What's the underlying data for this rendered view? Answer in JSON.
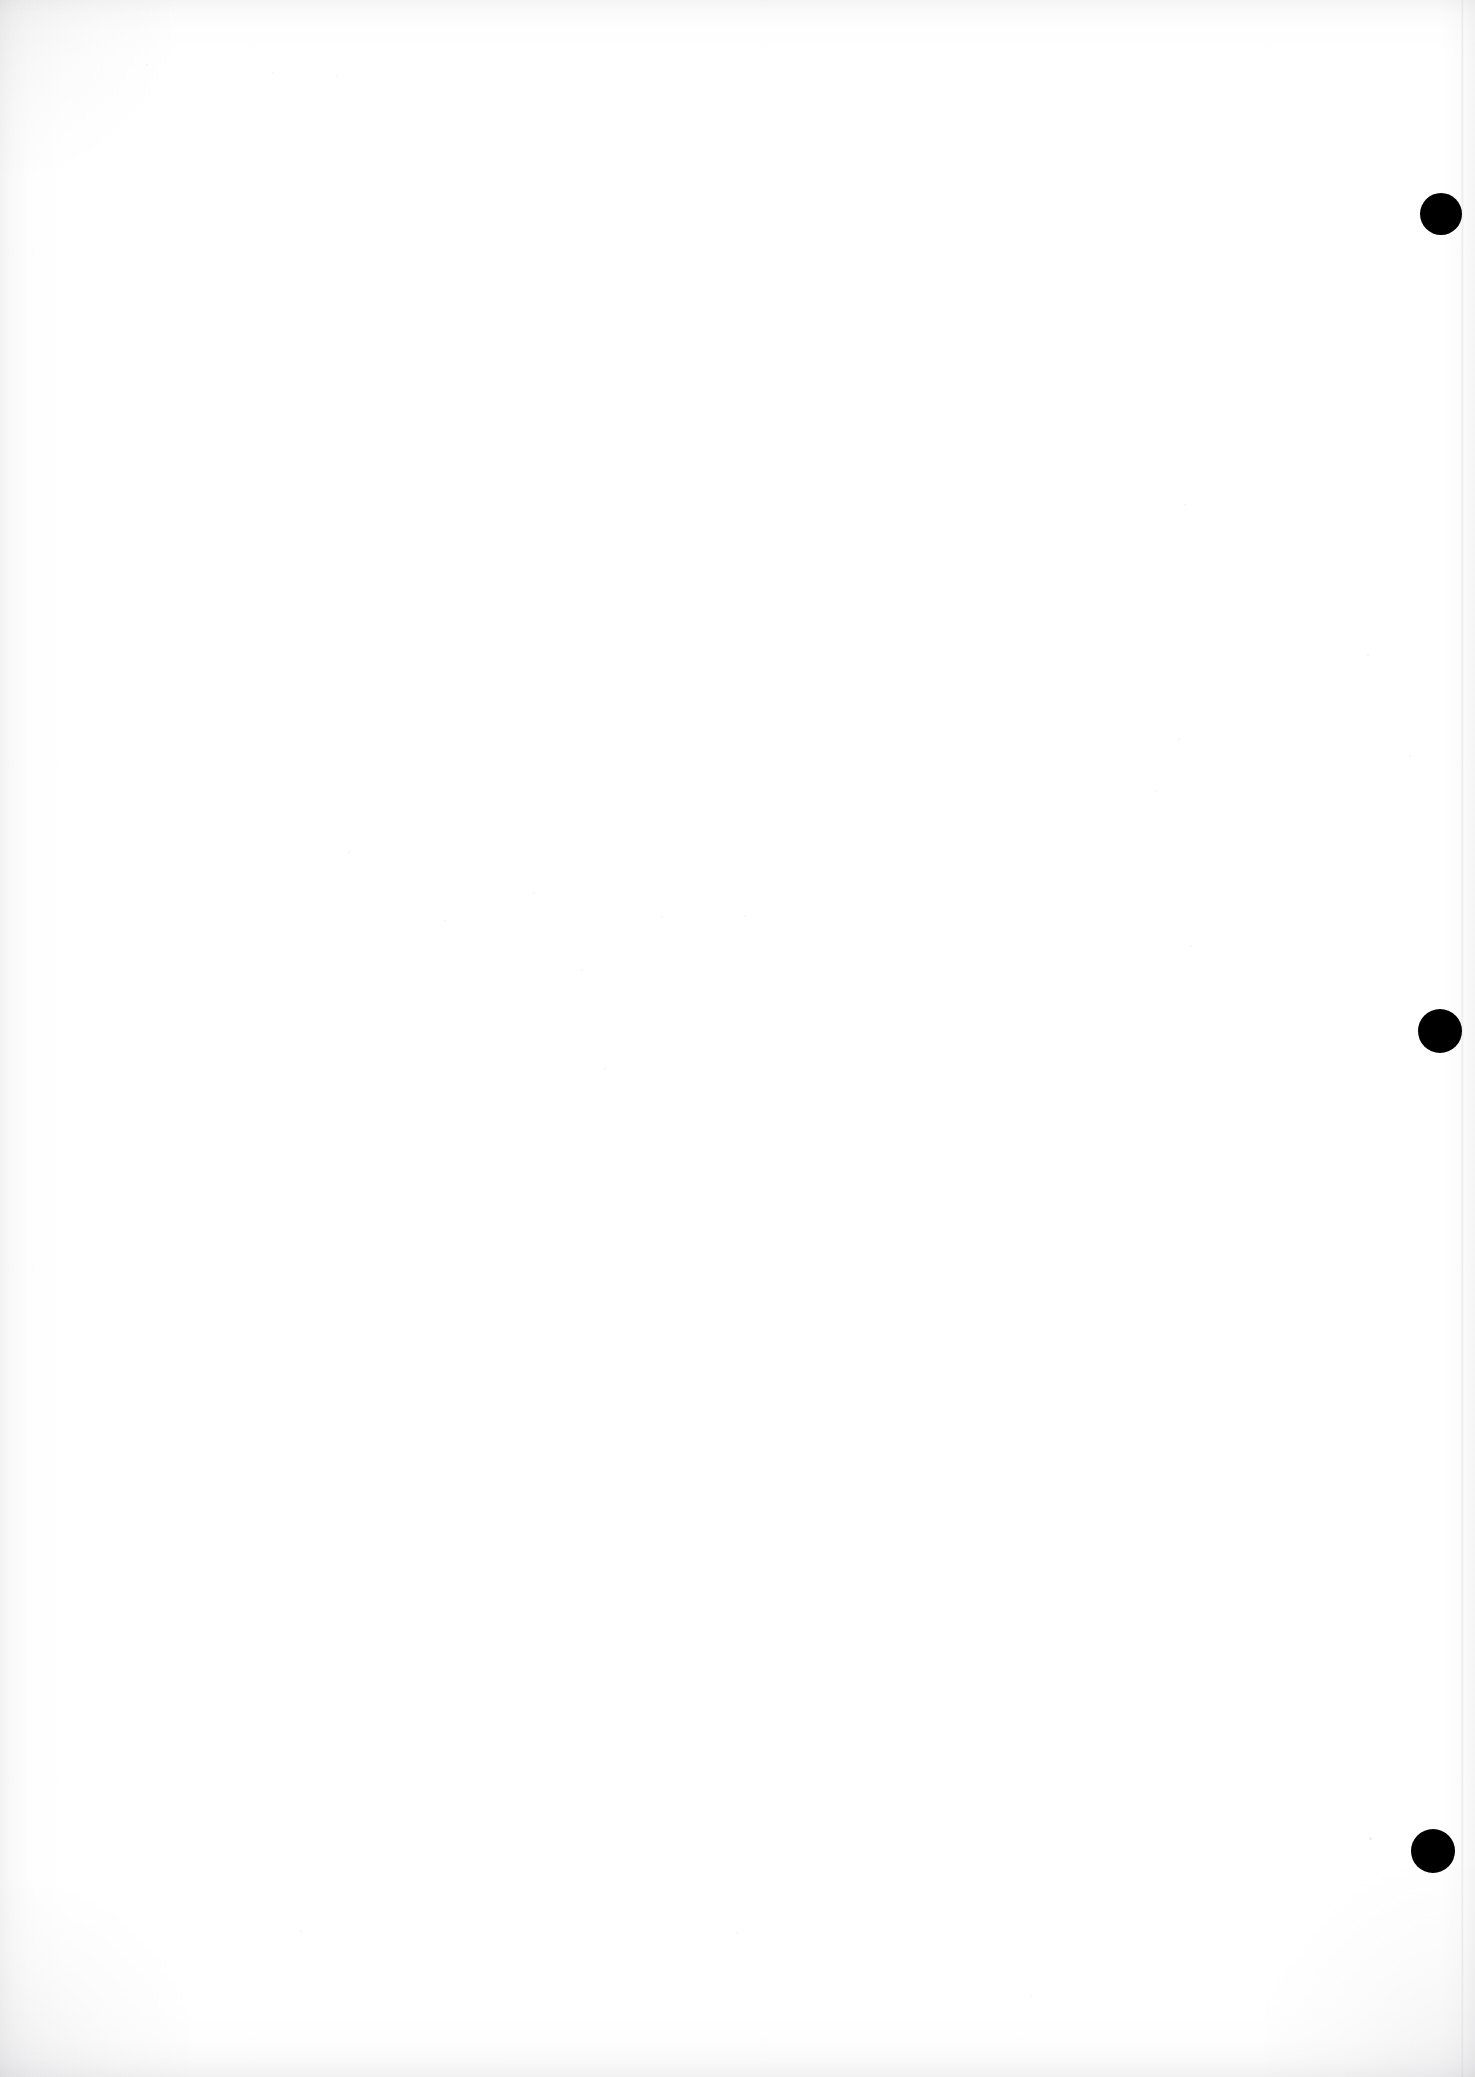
{
  "document": {
    "kind": "scanned-page",
    "page_description": "Blank scanned book or document page",
    "page_width": 1475,
    "page_height": 2077,
    "background_color": "#ffffff",
    "body_text": "",
    "header_text": "",
    "footer_text": "",
    "page_number_text": ""
  },
  "marks": {
    "label": "margin-marks",
    "color": "#000000",
    "count": 3,
    "items": [
      {
        "name": "margin-mark-top",
        "shape": "filled-circle",
        "color": "#000000",
        "center_x": 1441,
        "center_y": 214,
        "diameter": 42
      },
      {
        "name": "margin-mark-middle",
        "shape": "filled-circle",
        "color": "#000000",
        "center_x": 1440,
        "center_y": 1031,
        "diameter": 44
      },
      {
        "name": "margin-mark-bottom",
        "shape": "filled-circle",
        "color": "#000000",
        "center_x": 1433,
        "center_y": 1851,
        "diameter": 44
      }
    ]
  },
  "scan_artifacts": {
    "page_edge_line_x": 1462,
    "edge_shadow_color": "#8e8e95",
    "specks": [
      {
        "x": 1369,
        "y": 1837,
        "size": 3,
        "opacity": 0.16
      },
      {
        "x": 444,
        "y": 920,
        "size": 2,
        "opacity": 0.1
      },
      {
        "x": 348,
        "y": 852,
        "size": 2,
        "opacity": 0.09
      },
      {
        "x": 533,
        "y": 892,
        "size": 2,
        "opacity": 0.09
      },
      {
        "x": 581,
        "y": 969,
        "size": 2,
        "opacity": 0.08
      },
      {
        "x": 661,
        "y": 916,
        "size": 2,
        "opacity": 0.08
      },
      {
        "x": 744,
        "y": 915,
        "size": 2,
        "opacity": 0.09
      },
      {
        "x": 604,
        "y": 1068,
        "size": 2,
        "opacity": 0.08
      },
      {
        "x": 1184,
        "y": 504,
        "size": 2,
        "opacity": 0.1
      },
      {
        "x": 1367,
        "y": 654,
        "size": 2,
        "opacity": 0.09
      },
      {
        "x": 1178,
        "y": 738,
        "size": 2,
        "opacity": 0.08
      },
      {
        "x": 1409,
        "y": 755,
        "size": 2,
        "opacity": 0.08
      },
      {
        "x": 1155,
        "y": 790,
        "size": 2,
        "opacity": 0.08
      },
      {
        "x": 1190,
        "y": 945,
        "size": 2,
        "opacity": 0.08
      },
      {
        "x": 272,
        "y": 72,
        "size": 2,
        "opacity": 0.09
      },
      {
        "x": 146,
        "y": 64,
        "size": 2,
        "opacity": 0.09
      },
      {
        "x": 336,
        "y": 75,
        "size": 2,
        "opacity": 0.08
      },
      {
        "x": 300,
        "y": 1930,
        "size": 2,
        "opacity": 0.08
      },
      {
        "x": 736,
        "y": 1932,
        "size": 2,
        "opacity": 0.08
      },
      {
        "x": 1030,
        "y": 1995,
        "size": 2,
        "opacity": 0.08
      }
    ]
  }
}
